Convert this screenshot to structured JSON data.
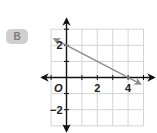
{
  "badge": {
    "label": "B"
  },
  "chart_data": {
    "type": "line",
    "title": "",
    "xlabel": "",
    "ylabel": "",
    "xlim": [
      -1,
      5
    ],
    "ylim": [
      -3,
      3
    ],
    "grid": true,
    "origin_label": "O",
    "x_tick_labels": [
      {
        "value": 2,
        "label": "2"
      },
      {
        "value": 4,
        "label": "4"
      }
    ],
    "y_tick_labels": [
      {
        "value": 2,
        "label": "2"
      },
      {
        "value": -2,
        "label": "−2"
      }
    ],
    "series": [
      {
        "name": "line",
        "equation": "y = -0.5x + 2",
        "points": [
          [
            0,
            2
          ],
          [
            4,
            0
          ]
        ],
        "extends": [
          [
            -0.8,
            2.4
          ],
          [
            4.8,
            -0.4
          ]
        ],
        "color": "#8a8a8a"
      }
    ]
  },
  "colors": {
    "grid": "#d4d4d4",
    "axis": "#111111",
    "line": "#8a8a8a",
    "badge_bg": "#cfcfcf",
    "badge_text": "#7a7a7a"
  }
}
